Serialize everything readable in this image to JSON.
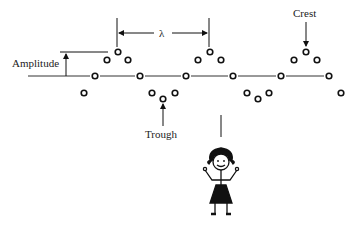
{
  "diagram": {
    "labels": {
      "amplitude": "Amplitude",
      "wavelength": "λ",
      "crest": "Crest",
      "trough": "Trough"
    },
    "colors": {
      "ink": "#111111",
      "background": "#ffffff"
    },
    "baseline_y": 76,
    "particles": [
      {
        "x": 84,
        "y": 93
      },
      {
        "x": 95,
        "y": 76
      },
      {
        "x": 107,
        "y": 60
      },
      {
        "x": 118,
        "y": 52
      },
      {
        "x": 128,
        "y": 60
      },
      {
        "x": 140,
        "y": 76
      },
      {
        "x": 152,
        "y": 93
      },
      {
        "x": 163,
        "y": 99
      },
      {
        "x": 175,
        "y": 93
      },
      {
        "x": 186,
        "y": 76
      },
      {
        "x": 198,
        "y": 60
      },
      {
        "x": 210,
        "y": 52
      },
      {
        "x": 221,
        "y": 60
      },
      {
        "x": 233,
        "y": 76
      },
      {
        "x": 247,
        "y": 93
      },
      {
        "x": 258,
        "y": 99
      },
      {
        "x": 269,
        "y": 93
      },
      {
        "x": 281,
        "y": 76
      },
      {
        "x": 294,
        "y": 60
      },
      {
        "x": 306,
        "y": 52
      },
      {
        "x": 317,
        "y": 60
      },
      {
        "x": 329,
        "y": 76
      },
      {
        "x": 341,
        "y": 93
      }
    ],
    "figure": {
      "name": "stick-figure-girl",
      "x": 221
    }
  }
}
